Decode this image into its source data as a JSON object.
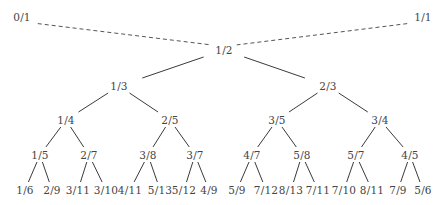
{
  "nodes": [
    {
      "id": "n0_1",
      "label": "0/1",
      "x": 22,
      "y": 17
    },
    {
      "id": "n1_1",
      "label": "1/1",
      "x": 423,
      "y": 17
    },
    {
      "id": "n1_2",
      "label": "1/2",
      "x": 224,
      "y": 50
    },
    {
      "id": "n1_3",
      "label": "1/3",
      "x": 119,
      "y": 86
    },
    {
      "id": "n2_3",
      "label": "2/3",
      "x": 328,
      "y": 86
    },
    {
      "id": "n1_4",
      "label": "1/4",
      "x": 66,
      "y": 120
    },
    {
      "id": "n2_5",
      "label": "2/5",
      "x": 170,
      "y": 120
    },
    {
      "id": "n3_5",
      "label": "3/5",
      "x": 277,
      "y": 120
    },
    {
      "id": "n3_4",
      "label": "3/4",
      "x": 380,
      "y": 120
    },
    {
      "id": "n1_5",
      "label": "1/5",
      "x": 40,
      "y": 155
    },
    {
      "id": "n2_7",
      "label": "2/7",
      "x": 89,
      "y": 155
    },
    {
      "id": "n3_8",
      "label": "3/8",
      "x": 148,
      "y": 155
    },
    {
      "id": "n3_7",
      "label": "3/7",
      "x": 195,
      "y": 155
    },
    {
      "id": "n4_7",
      "label": "4/7",
      "x": 252,
      "y": 155
    },
    {
      "id": "n5_8",
      "label": "5/8",
      "x": 302,
      "y": 155
    },
    {
      "id": "n5_7",
      "label": "5/7",
      "x": 356,
      "y": 155
    },
    {
      "id": "n4_5",
      "label": "4/5",
      "x": 410,
      "y": 155
    },
    {
      "id": "n1_6",
      "label": "1/6",
      "x": 25,
      "y": 190
    },
    {
      "id": "n2_9",
      "label": "2/9",
      "x": 52,
      "y": 190
    },
    {
      "id": "n3_11",
      "label": "3/11",
      "x": 78,
      "y": 190
    },
    {
      "id": "n3_10",
      "label": "3/10",
      "x": 106,
      "y": 190
    },
    {
      "id": "n4_11",
      "label": "4/11",
      "x": 130,
      "y": 190
    },
    {
      "id": "n5_13",
      "label": "5/13",
      "x": 160,
      "y": 190
    },
    {
      "id": "n5_12",
      "label": "5/12",
      "x": 184,
      "y": 190
    },
    {
      "id": "n4_9",
      "label": "4/9",
      "x": 209,
      "y": 190
    },
    {
      "id": "n5_9",
      "label": "5/9",
      "x": 237,
      "y": 190
    },
    {
      "id": "n7_12",
      "label": "7/12",
      "x": 266,
      "y": 190
    },
    {
      "id": "n8_13",
      "label": "8/13",
      "x": 291,
      "y": 190
    },
    {
      "id": "n7_11",
      "label": "7/11",
      "x": 318,
      "y": 190
    },
    {
      "id": "n7_10",
      "label": "7/10",
      "x": 344,
      "y": 190
    },
    {
      "id": "n8_11",
      "label": "8/11",
      "x": 372,
      "y": 190
    },
    {
      "id": "n7_9",
      "label": "7/9",
      "x": 398,
      "y": 190
    },
    {
      "id": "n5_6",
      "label": "5/6",
      "x": 423,
      "y": 190
    }
  ],
  "edges": [
    {
      "from": "n0_1",
      "to": "n1_2",
      "style": "dashed"
    },
    {
      "from": "n1_1",
      "to": "n1_2",
      "style": "dashed"
    },
    {
      "from": "n1_2",
      "to": "n1_3",
      "style": "solid"
    },
    {
      "from": "n1_2",
      "to": "n2_3",
      "style": "solid"
    },
    {
      "from": "n1_3",
      "to": "n1_4",
      "style": "solid"
    },
    {
      "from": "n1_3",
      "to": "n2_5",
      "style": "solid"
    },
    {
      "from": "n2_3",
      "to": "n3_5",
      "style": "solid"
    },
    {
      "from": "n2_3",
      "to": "n3_4",
      "style": "solid"
    },
    {
      "from": "n1_4",
      "to": "n1_5",
      "style": "solid"
    },
    {
      "from": "n1_4",
      "to": "n2_7",
      "style": "solid"
    },
    {
      "from": "n2_5",
      "to": "n3_8",
      "style": "solid"
    },
    {
      "from": "n2_5",
      "to": "n3_7",
      "style": "solid"
    },
    {
      "from": "n3_5",
      "to": "n4_7",
      "style": "solid"
    },
    {
      "from": "n3_5",
      "to": "n5_8",
      "style": "solid"
    },
    {
      "from": "n3_4",
      "to": "n5_7",
      "style": "solid"
    },
    {
      "from": "n3_4",
      "to": "n4_5",
      "style": "solid"
    },
    {
      "from": "n1_5",
      "to": "n1_6",
      "style": "solid"
    },
    {
      "from": "n1_5",
      "to": "n2_9",
      "style": "solid"
    },
    {
      "from": "n2_7",
      "to": "n3_11",
      "style": "solid"
    },
    {
      "from": "n2_7",
      "to": "n3_10",
      "style": "solid"
    },
    {
      "from": "n3_8",
      "to": "n4_11",
      "style": "solid"
    },
    {
      "from": "n3_8",
      "to": "n5_13",
      "style": "solid"
    },
    {
      "from": "n3_7",
      "to": "n5_12",
      "style": "solid"
    },
    {
      "from": "n3_7",
      "to": "n4_9",
      "style": "solid"
    },
    {
      "from": "n4_7",
      "to": "n5_9",
      "style": "solid"
    },
    {
      "from": "n4_7",
      "to": "n7_12",
      "style": "solid"
    },
    {
      "from": "n5_8",
      "to": "n8_13",
      "style": "solid"
    },
    {
      "from": "n5_8",
      "to": "n7_11",
      "style": "solid"
    },
    {
      "from": "n5_7",
      "to": "n7_10",
      "style": "solid"
    },
    {
      "from": "n5_7",
      "to": "n8_11",
      "style": "solid"
    },
    {
      "from": "n4_5",
      "to": "n7_9",
      "style": "solid"
    },
    {
      "from": "n4_5",
      "to": "n5_6",
      "style": "solid"
    }
  ]
}
